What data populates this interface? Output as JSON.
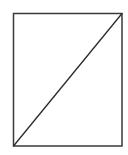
{
  "diagram": {
    "shapes": [
      {
        "type": "rect",
        "name": "outer-rectangle",
        "x": 13.5,
        "y": 13.5,
        "width": 108.5,
        "height": 132.5,
        "stroke": "#3a3a3a",
        "stroke_width": 1.5,
        "fill": "none"
      },
      {
        "type": "line",
        "name": "diagonal-line",
        "x1": 13.5,
        "y1": 146,
        "x2": 122,
        "y2": 13.5,
        "stroke": "#2a2a2a",
        "stroke_width": 1.3
      }
    ],
    "background": "#ffffff"
  }
}
